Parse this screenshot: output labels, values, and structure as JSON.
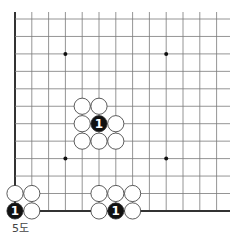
{
  "diagram": {
    "caption": "5도",
    "grid": {
      "x0": 15,
      "dx": 16.8,
      "cols": 14,
      "y0": 19,
      "dy": 17.45,
      "rows": 12,
      "right_fade_x": 230,
      "line_color": "#7a7a7a",
      "edge_color": "#333333"
    },
    "edges": [
      "left",
      "bottom"
    ],
    "star_points": [
      [
        3,
        2
      ],
      [
        9,
        2
      ],
      [
        3,
        8
      ],
      [
        9,
        8
      ]
    ],
    "stones": [
      {
        "color": "white",
        "col": 4,
        "row": 5
      },
      {
        "color": "white",
        "col": 5,
        "row": 5
      },
      {
        "color": "white",
        "col": 4,
        "row": 6
      },
      {
        "color": "black",
        "col": 5,
        "row": 6,
        "mark": "1"
      },
      {
        "color": "white",
        "col": 6,
        "row": 6
      },
      {
        "color": "white",
        "col": 4,
        "row": 7
      },
      {
        "color": "white",
        "col": 5,
        "row": 7
      },
      {
        "color": "white",
        "col": 6,
        "row": 7
      },
      {
        "color": "white",
        "col": 0,
        "row": 10
      },
      {
        "color": "white",
        "col": 1,
        "row": 10
      },
      {
        "color": "black",
        "col": 0,
        "row": 11,
        "mark": "1"
      },
      {
        "color": "white",
        "col": 1,
        "row": 11
      },
      {
        "color": "white",
        "col": 5,
        "row": 10
      },
      {
        "color": "white",
        "col": 6,
        "row": 10
      },
      {
        "color": "white",
        "col": 7,
        "row": 10
      },
      {
        "color": "white",
        "col": 5,
        "row": 11
      },
      {
        "color": "black",
        "col": 6,
        "row": 11,
        "mark": "1"
      },
      {
        "color": "white",
        "col": 7,
        "row": 11
      }
    ],
    "colors": {
      "black_stone": "#111111",
      "white_stone": "#ffffff",
      "stone_outline": "#333333",
      "mark_on_black": "#ffffff"
    }
  }
}
